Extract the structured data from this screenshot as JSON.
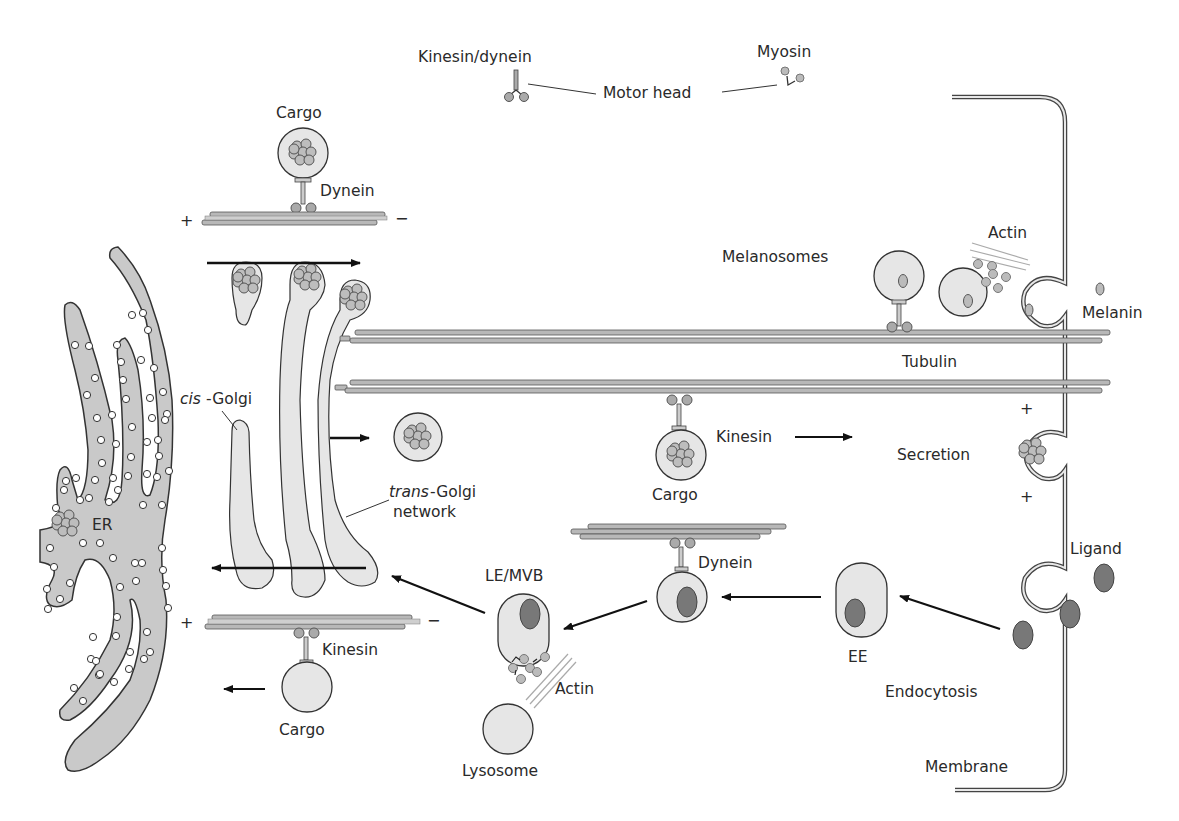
{
  "diagram": {
    "type": "intracellular-membrane-trafficking",
    "colors": {
      "organelle_fill": "#e6e6e6",
      "er_fill": "#c9c9c9",
      "outline": "#3a3a3a",
      "microtubule_fill": "#b8b8b8",
      "ligand_fill": "#787878",
      "cargo_bead_fill": "#bdbdbd",
      "actin_stroke": "#a8a8a8",
      "arrow": "#111111"
    },
    "labels": {
      "motor_legend": {
        "kinesin_dynein": "Kinesin/dynein",
        "myosin": "Myosin",
        "motor_head": "Motor head"
      },
      "top_dynein_unit": {
        "cargo": "Cargo",
        "motor": "Dynein",
        "plus": "+",
        "minus": "−"
      },
      "golgi": {
        "cis_prefix": "cis",
        "cis_suffix": "-Golgi",
        "trans_prefix": "trans",
        "trans_suffix": "-Golgi",
        "network": "network"
      },
      "er": "ER",
      "melanosomes": "Melanosomes",
      "actin_top": "Actin",
      "melanin": "Melanin",
      "tubulin": "Tubulin",
      "kinesin_mid": "Kinesin",
      "cargo_mid": "Cargo",
      "secretion": "Secretion",
      "membrane_plus_1": "+",
      "membrane_plus_2": "+",
      "dynein_mid": "Dynein",
      "le_mvb": "LE/MVB",
      "ee": "EE",
      "ligand": "Ligand",
      "endocytosis": "Endocytosis",
      "actin_bottom": "Actin",
      "lysosome": "Lysosome",
      "membrane": "Membrane",
      "bottom_kinesin_unit": {
        "motor": "Kinesin",
        "cargo": "Cargo",
        "plus": "+",
        "minus": "−"
      }
    }
  }
}
